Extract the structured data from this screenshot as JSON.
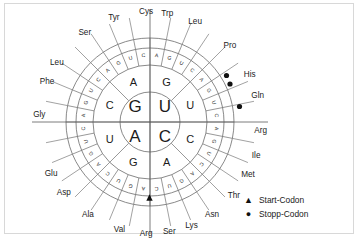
{
  "diagram": {
    "center": {
      "cx": 145,
      "cy": 118
    },
    "radii": {
      "r1": 30,
      "r2": 57,
      "r3": 74,
      "r4": 84
    },
    "colors": {
      "line": "#6b6b6b",
      "text": "#1b1b1b",
      "frame": "#d8d8d8",
      "marker": "#111111"
    },
    "rings": {
      "first_base": [
        "G",
        "U",
        "C",
        "A"
      ],
      "first_base_positions": [
        "top-left",
        "top-right",
        "bottom-right",
        "bottom-left"
      ],
      "second_base": [
        "G",
        "U",
        "C",
        "A",
        "G",
        "U",
        "C",
        "A"
      ],
      "third_base": [
        "A",
        "G",
        "U",
        "C",
        "A",
        "G",
        "U",
        "C",
        "A",
        "G",
        "U",
        "C",
        "A",
        "G",
        "U",
        "C",
        "A",
        "G",
        "U",
        "C",
        "A",
        "G",
        "U",
        "C",
        "A",
        "G",
        "U",
        "C",
        "A",
        "G",
        "U",
        "C"
      ]
    },
    "amino_acids": [
      {
        "label": "Gly",
        "angle": -86
      },
      {
        "label": "Phe",
        "angle": -68
      },
      {
        "label": "Leu",
        "angle": -57
      },
      {
        "label": "Ser",
        "angle": -36
      },
      {
        "label": "Tyr",
        "angle": -19
      },
      {
        "label": "Cys",
        "angle": -2
      },
      {
        "label": "Trp",
        "angle": 9
      },
      {
        "label": "Leu",
        "angle": 24
      },
      {
        "label": "Pro",
        "angle": 46
      },
      {
        "label": "His",
        "angle": 64
      },
      {
        "label": "Gln",
        "angle": 76
      },
      {
        "label": "Arg",
        "angle": 94
      },
      {
        "label": "Ile",
        "angle": 107
      },
      {
        "label": "Met",
        "angle": 118
      },
      {
        "label": "Thr",
        "angle": 131
      },
      {
        "label": "Asn",
        "angle": 146
      },
      {
        "label": "Lys",
        "angle": 158
      },
      {
        "label": "Ser",
        "angle": 170
      },
      {
        "label": "Arg",
        "angle": 182
      },
      {
        "label": "Val",
        "angle": 196
      },
      {
        "label": "Ala",
        "angle": 214
      },
      {
        "label": "Asp",
        "angle": 231
      },
      {
        "label": "Glu",
        "angle": 243
      }
    ],
    "markers": {
      "start": [
        {
          "codon": "AUG",
          "x": 144.5,
          "y": 193.5
        }
      ],
      "stop": [
        {
          "codon": "UAA",
          "x": 221.5,
          "y": 71.5
        },
        {
          "codon": "UAG",
          "x": 225.0,
          "y": 80.0
        },
        {
          "codon": "UGA",
          "x": 234.5,
          "y": 102.5
        }
      ]
    }
  },
  "legend": {
    "items": [
      {
        "glyph": "▲",
        "label": "Start-Codon",
        "marker": "triangle"
      },
      {
        "glyph": "●",
        "label": "Stopp-Codon",
        "marker": "circle"
      }
    ]
  }
}
